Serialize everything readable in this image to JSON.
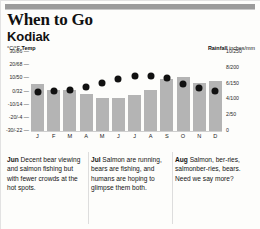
{
  "header": {
    "title": "When to Go",
    "subtitle": "Kodiak"
  },
  "legend": {
    "temp_bold": "Temp",
    "temp_units": "°C/°F",
    "rain_bold": "Rainfall",
    "rain_units": "inches/mm"
  },
  "chart_data": {
    "type": "bar",
    "title": "Kodiak",
    "xlabel": "",
    "ylabel": "°C/°F Temp",
    "y2label": "Rainfall inches/mm",
    "grid": false,
    "legend_position": "top",
    "categories": [
      "J",
      "F",
      "M",
      "A",
      "M",
      "J",
      "J",
      "A",
      "S",
      "O",
      "N",
      "D"
    ],
    "left_axis": {
      "label": "°C/°F Temp",
      "ticks": [
        "30/86",
        "20/68",
        "10/50",
        "0/32",
        "-10/14",
        "-20/-4",
        "-30/-22"
      ],
      "values": [
        30,
        20,
        10,
        0,
        -10,
        -20,
        -30
      ],
      "ylim": [
        -30,
        30
      ]
    },
    "right_axis": {
      "label": "Rainfall inches/mm",
      "ticks": [
        "10/250",
        "8/200",
        "6/150",
        "4/100",
        "2/50",
        "0"
      ],
      "values": [
        10,
        8,
        6,
        4,
        2,
        0
      ],
      "ylim": [
        0,
        10
      ]
    },
    "series": [
      {
        "name": "Rainfall",
        "type": "bar",
        "unit": "inches",
        "axis": "right",
        "values": [
          6.0,
          5.2,
          5.2,
          4.7,
          4.2,
          4.2,
          4.5,
          5.2,
          6.6,
          6.8,
          6.1,
          6.3
        ]
      },
      {
        "name": "Temp",
        "type": "scatter",
        "unit": "°C",
        "axis": "left",
        "values": [
          0.0,
          0.5,
          1.5,
          3.5,
          6.5,
          9.5,
          12.0,
          12.0,
          10.0,
          6.0,
          3.0,
          0.5
        ]
      }
    ]
  },
  "notes": [
    {
      "month": "Jun",
      "text": "Decent bear viewing and salmon fishing but with fewer crowds at the hot spots."
    },
    {
      "month": "Jul",
      "text": "Salmon are running, bears are fishing, and humans are hoping to glimpse them both."
    },
    {
      "month": "Aug",
      "text": "Salmon, ber-ries, salmonber-ries, bears. Need we say more?"
    }
  ]
}
